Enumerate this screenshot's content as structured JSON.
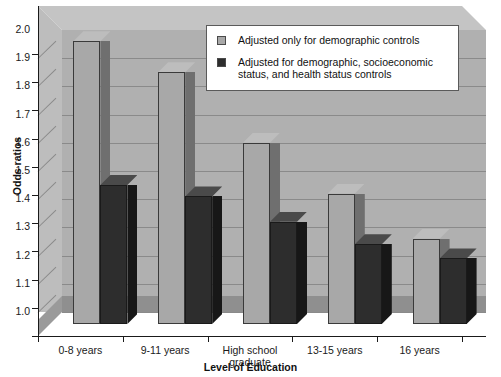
{
  "chart_data": {
    "type": "bar",
    "title": "",
    "xlabel": "Level of Education",
    "ylabel": "Odds ratios",
    "ylim": [
      1.0,
      2.0
    ],
    "yticks": [
      "2.0",
      "1.9",
      "1.8",
      "1.7",
      "1.6",
      "1.5",
      "1.4",
      "1.3",
      "1.2",
      "1.1",
      "1.0"
    ],
    "grid": true,
    "legend_position": "top-right-inside",
    "style": "3d-grouped-bar",
    "categories": [
      "0-8 years",
      "9-11 years",
      "High school graduate",
      "13-15 years",
      "16 years"
    ],
    "series": [
      {
        "name": "Adjusted only for demographic controls",
        "color": "#a8a8a8",
        "values": [
          1.96,
          1.85,
          1.6,
          1.42,
          1.26
        ]
      },
      {
        "name": "Adjusted for demographic, socioeconomic status, and health status controls",
        "color": "#2d2d2d",
        "values": [
          1.45,
          1.41,
          1.32,
          1.24,
          1.19
        ]
      }
    ]
  },
  "legend": {
    "items": [
      {
        "label": "Adjusted only for demographic controls",
        "swatch": "light-gray"
      },
      {
        "label": "Adjusted for demographic, socioeconomic status, and health status controls",
        "swatch": "dark-gray"
      }
    ]
  },
  "axes": {
    "y_title": "Odds ratios",
    "x_title": "Level of Education"
  },
  "category_labels": [
    {
      "line1": "0-8 years",
      "line2": ""
    },
    {
      "line1": "9-11 years",
      "line2": ""
    },
    {
      "line1": "High school",
      "line2": "graduate"
    },
    {
      "line1": "13-15 years",
      "line2": ""
    },
    {
      "line1": "16 years",
      "line2": ""
    }
  ],
  "colors": {
    "series_light": "#a8a8a8",
    "series_dark": "#2d2d2d",
    "plot_background": "#b0b0b0",
    "gridline": "#8a8a8a",
    "axis": "#1a1a1a"
  }
}
